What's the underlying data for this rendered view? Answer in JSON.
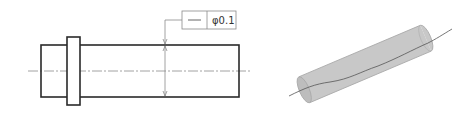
{
  "drawing": {
    "type": "geometric-tolerance-straightness-of-axis",
    "feature_control_frame": {
      "symbol": "straightness",
      "symbol_glyph": "—",
      "tolerance_text": "φ0.1"
    },
    "colors": {
      "outline": "#2a2a2a",
      "thin_line": "#8a8a8a",
      "cylinder_fill": "#c8c8c8",
      "cylinder_edge": "#a8a8a8",
      "axis_line": "#555555"
    }
  }
}
